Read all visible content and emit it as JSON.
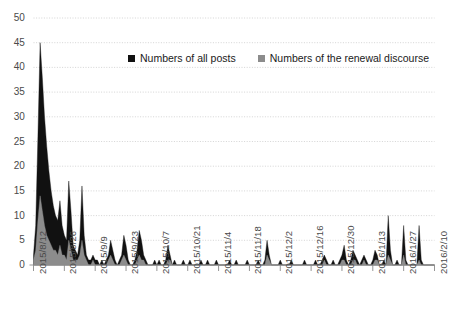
{
  "chart_data": {
    "type": "area",
    "title": "",
    "xlabel": "",
    "ylabel": "",
    "ylim": [
      0,
      50
    ],
    "ytick_step": 5,
    "yticks": [
      "0",
      "5",
      "10",
      "15",
      "20",
      "25",
      "30",
      "35",
      "40",
      "45",
      "50"
    ],
    "grid": true,
    "grid_color": "#c9c9c9",
    "axis_color": "#8a8a8a",
    "background": "#ffffff",
    "legend_position": "top-center",
    "x_tick_labels": [
      "2015/8/12",
      "2015/8/26",
      "2015/9/9",
      "2015/9/23",
      "2015/10/7",
      "2015/10/21",
      "2015/11/4",
      "2015/11/18",
      "2015/12/2",
      "2015/12/16",
      "2015/12/30",
      "2016/1/13",
      "2016/1/27",
      "2016/2/10"
    ],
    "x_tick_interval_days": 14,
    "x_start": "2015/8/12",
    "x_end": "2016/2/10",
    "n_points": 183,
    "series": [
      {
        "name": "Numbers of all posts",
        "color": "#111111",
        "values": [
          2,
          8,
          26,
          45,
          38,
          30,
          24,
          19,
          15,
          12,
          10,
          9,
          13,
          8,
          6,
          5,
          17,
          11,
          4,
          3,
          2,
          5,
          16,
          6,
          2,
          1,
          1,
          2,
          1,
          1,
          0,
          1,
          0,
          1,
          2,
          5,
          3,
          1,
          0,
          1,
          2,
          6,
          4,
          1,
          0,
          0,
          1,
          3,
          7,
          5,
          2,
          1,
          0,
          0,
          0,
          1,
          0,
          1,
          0,
          0,
          1,
          4,
          2,
          0,
          1,
          0,
          0,
          0,
          1,
          0,
          0,
          1,
          0,
          0,
          0,
          0,
          1,
          0,
          0,
          1,
          0,
          0,
          0,
          1,
          0,
          0,
          0,
          0,
          0,
          1,
          0,
          0,
          1,
          0,
          0,
          0,
          0,
          1,
          0,
          0,
          0,
          0,
          1,
          0,
          0,
          1,
          5,
          2,
          0,
          0,
          0,
          0,
          1,
          0,
          0,
          0,
          0,
          1,
          0,
          0,
          0,
          0,
          0,
          1,
          0,
          0,
          0,
          0,
          1,
          0,
          0,
          1,
          2,
          1,
          0,
          0,
          1,
          0,
          0,
          1,
          2,
          4,
          1,
          0,
          1,
          3,
          2,
          1,
          0,
          1,
          2,
          1,
          0,
          0,
          1,
          3,
          2,
          0,
          0,
          1,
          0,
          10,
          3,
          0,
          0,
          1,
          0,
          0,
          8,
          1,
          0,
          0,
          0,
          0,
          0,
          8,
          1,
          0,
          0,
          0,
          0,
          0,
          0
        ]
      },
      {
        "name": "Numbers of the renewal discourse",
        "color": "#8c8c8c",
        "values": [
          1,
          3,
          9,
          14,
          11,
          8,
          6,
          5,
          4,
          3,
          3,
          2,
          4,
          2,
          2,
          1,
          5,
          3,
          1,
          1,
          1,
          2,
          5,
          2,
          1,
          0,
          0,
          1,
          0,
          0,
          0,
          0,
          0,
          0,
          1,
          2,
          1,
          0,
          0,
          0,
          1,
          2,
          1,
          0,
          0,
          0,
          0,
          1,
          2,
          1,
          1,
          0,
          0,
          0,
          0,
          0,
          0,
          0,
          0,
          0,
          0,
          1,
          1,
          0,
          0,
          0,
          0,
          0,
          0,
          0,
          0,
          0,
          0,
          0,
          0,
          0,
          0,
          0,
          0,
          0,
          0,
          0,
          0,
          0,
          0,
          0,
          0,
          0,
          0,
          0,
          0,
          0,
          0,
          0,
          0,
          0,
          0,
          0,
          0,
          0,
          0,
          0,
          0,
          0,
          0,
          0,
          2,
          1,
          0,
          0,
          0,
          0,
          0,
          0,
          0,
          0,
          0,
          0,
          0,
          0,
          0,
          0,
          0,
          0,
          0,
          0,
          0,
          0,
          0,
          0,
          0,
          0,
          1,
          0,
          0,
          0,
          0,
          0,
          0,
          0,
          1,
          1,
          0,
          0,
          0,
          1,
          1,
          0,
          0,
          0,
          1,
          0,
          0,
          0,
          0,
          1,
          1,
          0,
          0,
          0,
          0,
          2,
          1,
          0,
          0,
          0,
          0,
          0,
          2,
          0,
          0,
          0,
          0,
          0,
          0,
          1,
          0,
          0,
          0,
          0,
          0,
          0,
          0
        ]
      }
    ]
  },
  "legend": {
    "items": [
      {
        "label": "Numbers of all posts",
        "color": "#111111"
      },
      {
        "label": "Numbers of the renewal discourse",
        "color": "#8c8c8c"
      }
    ]
  }
}
